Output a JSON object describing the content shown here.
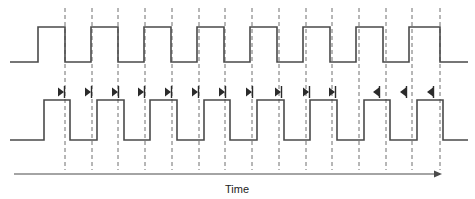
{
  "figure": {
    "type": "timing-diagram",
    "background_color": "#ffffff",
    "wave_color": "#4a4a4a",
    "grid_color": "#6e6e6e",
    "marker_color": "#2b2b2b",
    "axis_label": "Time"
  },
  "chart_data": {
    "type": "line",
    "title": "",
    "xlabel": "Time",
    "ylabel": "",
    "grid": true,
    "legend_position": "none",
    "xlim": [
      0,
      475
    ],
    "gridline_x": [
      65,
      92,
      118,
      145,
      172,
      199,
      225,
      252,
      279,
      306,
      332,
      359,
      386,
      412,
      440
    ],
    "series": [
      {
        "name": "clock-upper",
        "low_y": 62,
        "high_y": 27,
        "start_x": 10,
        "end_x": 468,
        "start_level": "low",
        "transitions_x": [
          38,
          65,
          91,
          118,
          144,
          171,
          197,
          224,
          250,
          277,
          303,
          330,
          356,
          383,
          409,
          440
        ],
        "edge_types": [
          "rise",
          "fall",
          "rise",
          "fall",
          "rise",
          "fall",
          "rise",
          "fall",
          "rise",
          "fall",
          "rise",
          "fall",
          "rise",
          "fall",
          "rise",
          "fall"
        ]
      },
      {
        "name": "clock-lower",
        "low_y": 140,
        "high_y": 100,
        "start_x": 10,
        "end_x": 468,
        "start_level": "low",
        "transitions_x": [
          44,
          70,
          97,
          124,
          150,
          177,
          204,
          230,
          257,
          284,
          310,
          337,
          364,
          390,
          417,
          443
        ],
        "edge_types": [
          "rise",
          "fall",
          "rise",
          "fall",
          "rise",
          "fall",
          "rise",
          "fall",
          "rise",
          "fall",
          "rise",
          "fall",
          "rise",
          "fall",
          "rise",
          "fall"
        ]
      }
    ],
    "markers": [
      {
        "x": 64,
        "y": 92,
        "direction": "right"
      },
      {
        "x": 91,
        "y": 92,
        "direction": "right"
      },
      {
        "x": 118,
        "y": 92,
        "direction": "right"
      },
      {
        "x": 144,
        "y": 92,
        "direction": "right"
      },
      {
        "x": 171,
        "y": 92,
        "direction": "right"
      },
      {
        "x": 198,
        "y": 92,
        "direction": "right"
      },
      {
        "x": 225,
        "y": 92,
        "direction": "right"
      },
      {
        "x": 252,
        "y": 92,
        "direction": "right"
      },
      {
        "x": 281,
        "y": 92,
        "direction": "right"
      },
      {
        "x": 309,
        "y": 92,
        "direction": "right"
      },
      {
        "x": 335,
        "y": 92,
        "direction": "right"
      },
      {
        "x": 379,
        "y": 92,
        "direction": "left"
      },
      {
        "x": 406,
        "y": 92,
        "direction": "left"
      },
      {
        "x": 433,
        "y": 92,
        "direction": "left"
      }
    ],
    "axis": {
      "x_start": 14,
      "x_end": 442,
      "y": 174,
      "label": "Time",
      "label_x": 237,
      "label_y": 193
    }
  }
}
